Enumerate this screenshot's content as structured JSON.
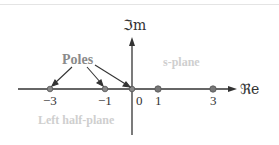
{
  "diagram": {
    "title": "s-plane",
    "axes": {
      "real_label": "ℜe",
      "imag_label": "ℑm"
    },
    "ticks": [
      {
        "value": -3,
        "label": "−3"
      },
      {
        "value": -1,
        "label": "−1"
      },
      {
        "value": 0,
        "label": "0"
      },
      {
        "value": 1,
        "label": "1"
      },
      {
        "value": 3,
        "label": "3"
      }
    ],
    "annotations": {
      "poles_label": "Poles",
      "region_left": "Left half-plane",
      "region_plane": "s-plane"
    },
    "points": [
      {
        "x": -3,
        "kind": "pole"
      },
      {
        "x": -1,
        "kind": "pole"
      },
      {
        "x": 0,
        "kind": "pole"
      },
      {
        "x": 1,
        "kind": "marker"
      },
      {
        "x": 3,
        "kind": "marker"
      }
    ],
    "colors": {
      "axis": "#333333",
      "pole": "#777777",
      "marker": "#888888",
      "region_text": "#cfcfcf",
      "poles_text": "#8a8a8a"
    }
  }
}
